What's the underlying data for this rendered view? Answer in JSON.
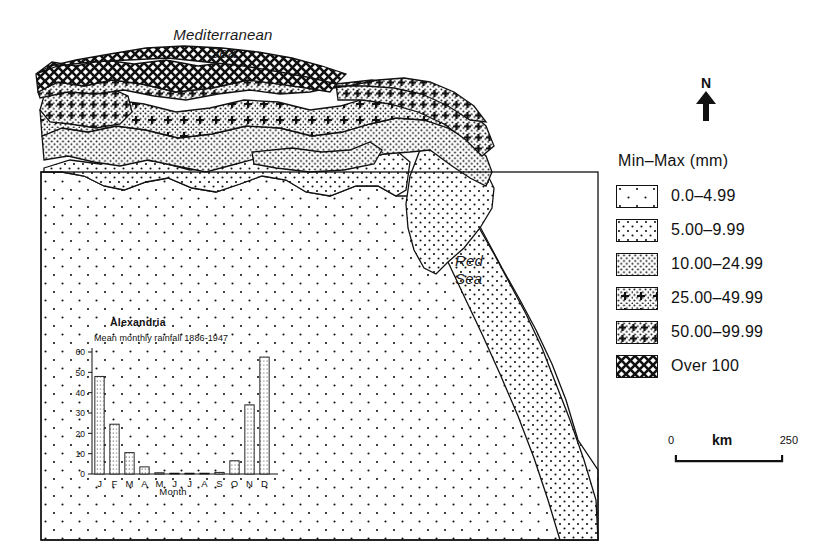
{
  "figure": {
    "sea_labels": [
      {
        "name": "mediterranean-sea",
        "line1": "Mediterranean",
        "line2": "Sea"
      },
      {
        "name": "red-sea",
        "line1": "Red",
        "line2": "Sea"
      }
    ],
    "north_arrow": {
      "letter": "N"
    }
  },
  "legend": {
    "title": "Min–Max (mm)",
    "items": [
      {
        "label": "0.0–4.99",
        "pattern": "sparse-dots"
      },
      {
        "label": "5.00–9.99",
        "pattern": "medium-dots"
      },
      {
        "label": "10.00–24.99",
        "pattern": "dense-dots"
      },
      {
        "label": "25.00–49.99",
        "pattern": "dots-with-crosses"
      },
      {
        "label": "50.00–99.99",
        "pattern": "cross-grid"
      },
      {
        "label": "Over 100",
        "pattern": "dense-crosshatch"
      }
    ]
  },
  "scale_bar": {
    "min": "0",
    "unit": "km",
    "max": "250"
  },
  "chart_data": {
    "type": "bar",
    "title": "Alexandria",
    "subtitle": "Mean monthly rainfall 1886-1947",
    "categories": [
      "J",
      "F",
      "M",
      "A",
      "M",
      "J",
      "J",
      "A",
      "S",
      "O",
      "N",
      "D"
    ],
    "values": [
      48,
      24.5,
      10.5,
      3.5,
      0.6,
      0.1,
      0.0,
      0.1,
      0.8,
      6.5,
      34,
      57.5
    ],
    "xlabel": "Month",
    "ylabel": "",
    "ylim": [
      0,
      60
    ],
    "yticks": [
      0,
      10,
      20,
      30,
      40,
      50,
      60
    ],
    "grid": false,
    "legend": "none",
    "bar_pattern": "vertical-dotted-lines"
  },
  "colors": {
    "ink": "#111111",
    "paper": "#ffffff"
  }
}
